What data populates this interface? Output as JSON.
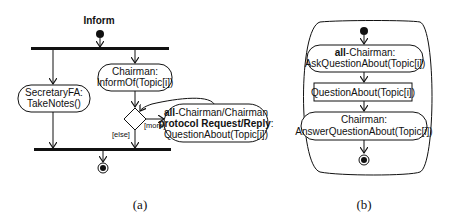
{
  "diagram_a": {
    "title": "Inform",
    "caption": "(a)",
    "actions": {
      "chairman_inform": {
        "line1": "Chairman:",
        "line2": "InformOf(Topic[i])"
      },
      "secretary": {
        "line1": "SecretaryFA:",
        "line2": "TakeNotes()"
      },
      "question": {
        "line1_bold": "all",
        "line1_rest": "-Chairman/Chairman",
        "line2_bold": "protocol Request/Reply",
        "line2_rest": ":",
        "line3": "QuestionAbout(Topic[i])"
      }
    },
    "guards": {
      "more": "[more]",
      "else": "[else]"
    }
  },
  "diagram_b": {
    "caption": "(b)",
    "actions": {
      "ask": {
        "line1_bold": "all",
        "line1_rest": "-Chairman:",
        "line2": "AskQuestionAbout(Topic[i])"
      },
      "object": {
        "label": "QuestionAbout(Topic[i])"
      },
      "answer": {
        "line1": "Chairman:",
        "line2": "AnswerQuestionAbout(Topic[i])"
      }
    }
  }
}
